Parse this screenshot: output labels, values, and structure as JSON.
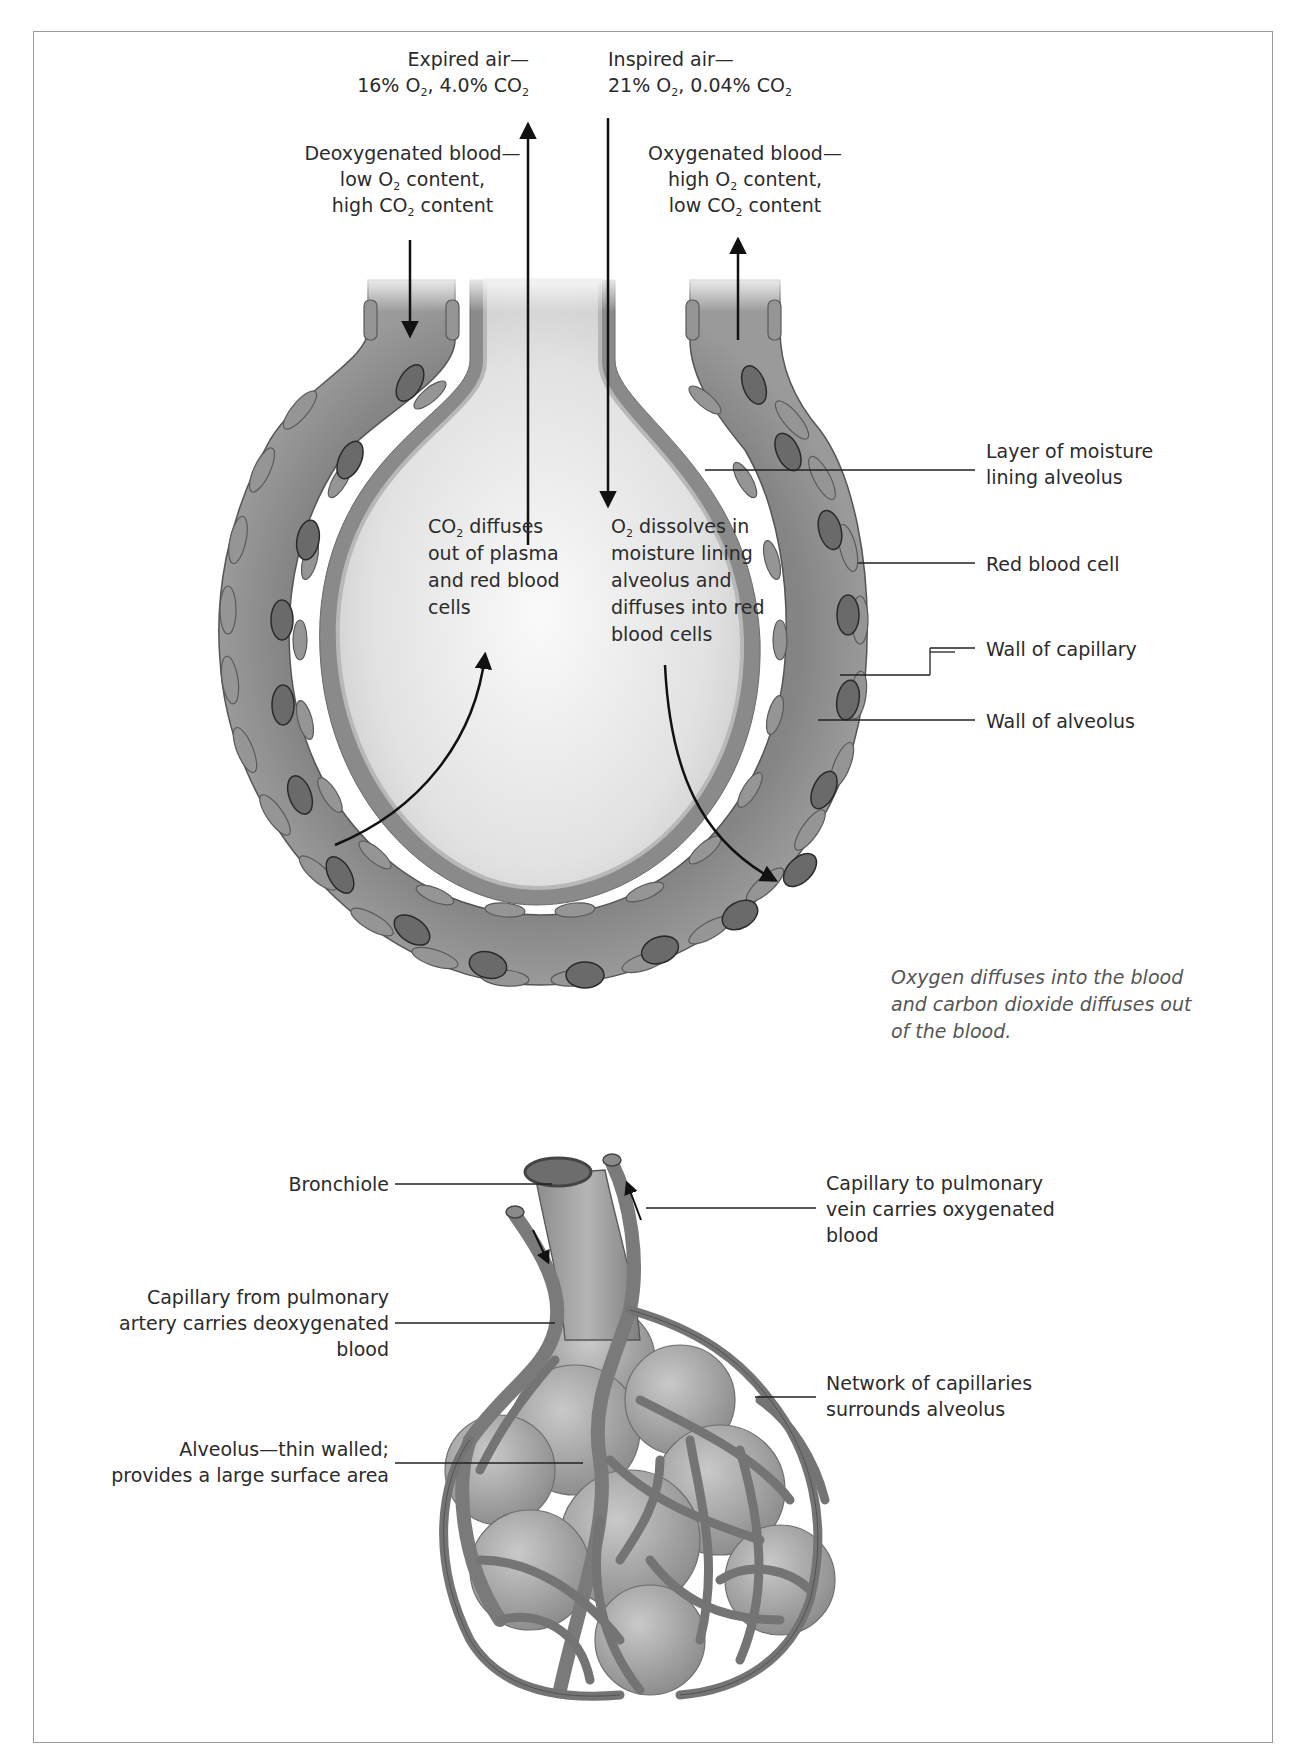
{
  "figure": {
    "type": "gas exchange in an alveolus",
    "top_labels": {
      "expired_air": {
        "line1": "Expired air—",
        "line2_pre": "16% O",
        "line2_sub1": "2",
        "line2_mid": ", 4.0% CO",
        "line2_sub2": "2"
      },
      "inspired_air": {
        "line1": "Inspired air—",
        "line2_pre": "21% O",
        "line2_sub1": "2",
        "line2_mid": ", 0.04% CO",
        "line2_sub2": "2"
      },
      "deoxygenated_blood": {
        "line1": "Deoxygenated blood—",
        "line2_pre": "low O",
        "line2_sub": "2",
        "line2_post": " content,",
        "line3_pre": "high CO",
        "line3_sub": "2",
        "line3_post": " content"
      },
      "oxygenated_blood": {
        "line1": "Oxygenated blood—",
        "line2_pre": "high O",
        "line2_sub": "2",
        "line2_post": " content,",
        "line3_pre": "low CO",
        "line3_sub": "2",
        "line3_post": " content"
      }
    },
    "interior_labels": {
      "co2_diffuses": {
        "line1_pre": "CO",
        "line1_sub": "2",
        "line1_post": " diffuses",
        "line2": "out of plasma",
        "line3": "and red blood",
        "line4": "cells"
      },
      "o2_dissolves": {
        "line1_pre": "O",
        "line1_sub": "2",
        "line1_post": " dissolves in",
        "line2": "moisture lining",
        "line3": "alveolus and",
        "line4": "diffuses into red",
        "line5": "blood cells"
      }
    },
    "right_labels": {
      "moisture": {
        "line1": "Layer of moisture",
        "line2": "lining alveolus"
      },
      "red_blood_cell": "Red blood cell",
      "wall_capillary": "Wall of capillary",
      "wall_alveolus": "Wall of alveolus"
    },
    "caption": {
      "line1": "Oxygen diffuses into the blood",
      "line2": "and carbon dioxide diffuses out",
      "line3": "of the blood."
    },
    "cluster_labels": {
      "bronchiole": "Bronchiole",
      "capillary_from_artery": {
        "line1": "Capillary from pulmonary",
        "line2": "artery carries deoxygenated",
        "line3": "blood"
      },
      "alveolus": {
        "line1": "Alveolus—thin walled;",
        "line2": "provides a large surface area"
      },
      "capillary_to_vein": {
        "line1": "Capillary to pulmonary",
        "line2": "vein carries oxygenated",
        "line3": "blood"
      },
      "network": {
        "line1": "Network of capillaries",
        "line2": "surrounds alveolus"
      }
    },
    "colors": {
      "capillary": "#7d7d7d",
      "capillary_cell": "#8e8e8e",
      "red_blood_cell": "#6a6a6a",
      "alveolus_wall": "#8a8a8a",
      "alveolus_interior": "#e6e6e6",
      "frame": "#9a9a9a",
      "text": "#2b2b2b"
    }
  }
}
